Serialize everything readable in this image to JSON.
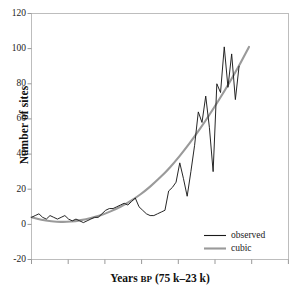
{
  "chart_data": {
    "type": "line",
    "title": "",
    "xlabel": "Years BP (75 k–23 k)",
    "xlabel_main": "Years",
    "xlabel_smallcaps": "BP",
    "xlabel_rest": "(75 k–23 k)",
    "ylabel": "Number of sites",
    "xlim": [
      0,
      52
    ],
    "ylim": [
      -20,
      120
    ],
    "yticks": [
      -20,
      0,
      20,
      40,
      60,
      80,
      100,
      120
    ],
    "ytick_labels": [
      "-20",
      "0",
      "20",
      "40",
      "60",
      "80",
      "100",
      "120"
    ],
    "xticks": [
      0,
      7.4,
      14.9,
      22.3,
      29.7,
      37.1,
      44.6,
      52
    ],
    "xtick_labels": [
      "",
      "",
      "",
      "",
      "",
      "",
      "",
      ""
    ],
    "grid": false,
    "legend_position": "lower-right",
    "colors": {
      "observed": "#1a1a1a",
      "cubic": "#9a9a9a",
      "frame": "#b8b8b8",
      "background": "#ffffff"
    },
    "series": [
      {
        "name": "observed",
        "color": "#1a1a1a",
        "x": [
          0,
          0.75,
          1.5,
          2.25,
          3,
          3.75,
          4.5,
          5.25,
          6,
          6.75,
          7.5,
          8.25,
          9,
          9.75,
          10.5,
          11.25,
          12,
          12.75,
          13.5,
          14.25,
          15,
          15.75,
          16.5,
          17.25,
          18,
          18.75,
          19.5,
          20.25,
          21,
          21.75,
          22.5,
          23.25,
          24,
          24.75,
          25.5,
          26.25,
          27,
          27.75,
          28.5,
          29.25,
          30,
          30.75,
          31.5,
          32.25,
          33,
          33.75,
          34.5,
          35.25,
          36,
          36.75,
          37.5,
          38.25,
          39,
          39.75,
          40.5,
          41.25,
          42
        ],
        "values": [
          4,
          5,
          6,
          4,
          3,
          5,
          4,
          3,
          4,
          5,
          3,
          2,
          3,
          2,
          1,
          2,
          3,
          4,
          4,
          6,
          8,
          9,
          9,
          10,
          11,
          12,
          11,
          13,
          15,
          10,
          8,
          6,
          5,
          5,
          6,
          7,
          8,
          19,
          21,
          24,
          35,
          26,
          16,
          30,
          45,
          64,
          58,
          73,
          55,
          30,
          80,
          75,
          101,
          78,
          97,
          71,
          90
        ]
      },
      {
        "name": "cubic",
        "color": "#9a9a9a",
        "x": [
          0,
          2,
          4,
          6,
          8,
          10,
          12,
          14,
          16,
          18,
          20,
          22,
          24,
          26,
          28,
          30,
          32,
          34,
          36,
          38,
          40,
          42,
          44
        ],
        "values": [
          4,
          2.6,
          1.8,
          1.4,
          1.6,
          2.4,
          3.6,
          5.2,
          7.4,
          10.0,
          13.2,
          17.0,
          21.5,
          26.6,
          32.4,
          39.0,
          46.2,
          54.0,
          62.4,
          71.2,
          80.5,
          90.4,
          101.0
        ]
      }
    ]
  },
  "legend": {
    "items": [
      {
        "label": "observed",
        "color": "#1a1a1a"
      },
      {
        "label": "cubic",
        "color": "#9a9a9a"
      }
    ]
  },
  "ticks": {
    "y": [
      {
        "label": "120"
      },
      {
        "label": "100"
      },
      {
        "label": "80"
      },
      {
        "label": "60"
      },
      {
        "label": "40"
      },
      {
        "label": "20"
      },
      {
        "label": "0"
      },
      {
        "label": "-20"
      }
    ]
  }
}
